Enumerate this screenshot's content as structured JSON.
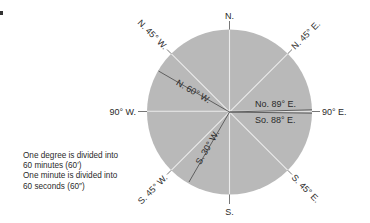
{
  "diagram": {
    "colors": {
      "disc": "#b9b9b9",
      "light_line": "#e8e8e8",
      "dark_line": "#555555",
      "text": "#2a2a2a"
    },
    "center": {
      "x": 229.5,
      "y": 112
    },
    "radius": 82.5,
    "cardinal_labels": {
      "north": "N.",
      "south": "S.",
      "east": "90° E.",
      "west": "90° W."
    },
    "intercardinal_labels": {
      "ne": "N. 45° E.",
      "nw": "N. 45° W.",
      "se": "S. 45° E.",
      "sw": "S. 45° W."
    },
    "bearings": [
      {
        "name": "N. 60° W.",
        "label": "N. 60° W."
      },
      {
        "name": "S. 30° W.",
        "label": "S. 30° W."
      },
      {
        "name": "No. 89° E.",
        "label": "No. 89° E."
      },
      {
        "name": "So. 88° E.",
        "label": "So. 88° E."
      }
    ],
    "note": {
      "lines": [
        "One degree is divided into",
        "60 minutes (60′)",
        "One minute is divided into",
        "60 seconds (60″)"
      ]
    }
  }
}
